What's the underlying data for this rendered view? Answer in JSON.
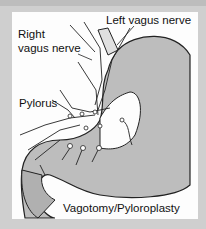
{
  "figure": {
    "labels": {
      "left_vagus": "Left vagus nerve",
      "right_vagus_line1": "Right",
      "right_vagus_line2": "vagus nerve",
      "pylorus": "Pylorus",
      "caption": "Vagotomy/Pyloroplasty"
    },
    "colors": {
      "frame": "#cfcfcf",
      "panel": "#fdfdfd",
      "stomach": "#bdbdbd",
      "lines": "#222222"
    }
  }
}
